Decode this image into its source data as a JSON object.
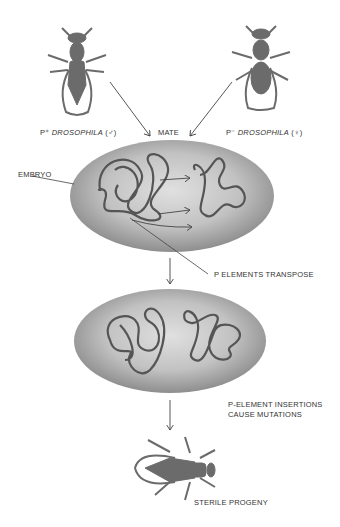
{
  "diagram": {
    "parents": {
      "male": {
        "prefix": "P⁺",
        "name": "DROSOPHILA",
        "sex": "(♂)"
      },
      "female": {
        "prefix": "P⁻",
        "name": "DROSOPHILA",
        "sex": "(♀)"
      }
    },
    "labels": {
      "mate": "MATE",
      "embryo": "EMBRYO",
      "transpose": "P ELEMENTS TRANSPOSE",
      "insertions_line1": "P-ELEMENT INSERTIONS",
      "insertions_line2": "CAUSE MUTATIONS",
      "progeny": "STERILE PROGENY"
    },
    "colors": {
      "fly": "#6b6b6b",
      "embryo_fill": "#b8b8b8",
      "embryo_edge": "#8a8a8a",
      "chromosome": "#555555",
      "arrow": "#444444",
      "text": "#333333"
    }
  }
}
